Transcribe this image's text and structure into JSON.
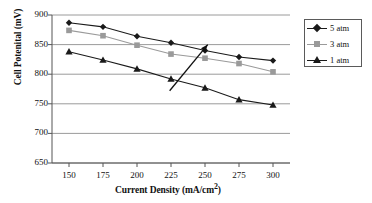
{
  "chart_data": {
    "type": "line",
    "title": "",
    "xlabel": "Current Density (mA/cm2)",
    "xlabel_main": "Current Density (mA/cm",
    "xlabel_sup": "2",
    "xlabel_tail": ")",
    "ylabel": "Cell Potenital (mV)",
    "x": [
      150,
      175,
      200,
      225,
      250,
      275,
      300
    ],
    "xticklabels": [
      "150",
      "175",
      "200",
      "225",
      "250",
      "275",
      "300"
    ],
    "yticks": [
      650,
      700,
      750,
      800,
      850,
      900
    ],
    "yticklabels": [
      "650",
      "700",
      "750",
      "800",
      "850",
      "900"
    ],
    "xlim": [
      137.5,
      312.5
    ],
    "ylim": [
      650,
      900
    ],
    "grid": "horizontal",
    "legend_position": "outside-right-top",
    "series": [
      {
        "name": "5 atm",
        "marker": "diamond",
        "color": "#1a1a1a",
        "values": [
          887,
          880,
          864,
          853,
          840,
          829,
          823
        ]
      },
      {
        "name": "3 atm",
        "marker": "square",
        "color": "#9a9a9a",
        "values": [
          874,
          865,
          849,
          834,
          827,
          818,
          804
        ]
      },
      {
        "name": "1 atm",
        "marker": "triangle",
        "color": "#1a1a1a",
        "values": [
          838,
          824,
          809,
          792,
          777,
          757,
          748
        ]
      }
    ],
    "annotations": [
      {
        "type": "arrow",
        "label": "",
        "from": [
          224,
          772
        ],
        "to": [
          252,
          850
        ],
        "color": "#111111"
      }
    ]
  },
  "legend": {
    "items": [
      {
        "label": "5 atm"
      },
      {
        "label": "3 atm"
      },
      {
        "label": "1 atm"
      }
    ]
  }
}
